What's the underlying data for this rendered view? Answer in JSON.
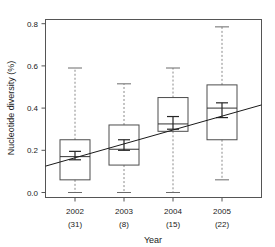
{
  "chart_data": {
    "type": "box",
    "title": "",
    "xlabel": "Year",
    "ylabel": "Nucleotide diversity (%)",
    "ylim": [
      0.0,
      0.83
    ],
    "yticks": [
      0.0,
      0.2,
      0.4,
      0.6,
      0.8
    ],
    "ytick_labels": [
      "0.0",
      "0.2",
      "0.4",
      "0.6",
      "0.8"
    ],
    "grid": false,
    "legend": null,
    "categories": [
      "2002",
      "2003",
      "2004",
      "2005"
    ],
    "sample_sizes": [
      "(31)",
      "(8)",
      "(15)",
      "(22)"
    ],
    "boxes": [
      {
        "category": "2002",
        "n": "(31)",
        "whisker_low": 0.0,
        "q1": 0.06,
        "median": 0.17,
        "q3": 0.25,
        "whisker_high": 0.59,
        "mean": 0.175,
        "ci_low": 0.155,
        "ci_high": 0.195
      },
      {
        "category": "2003",
        "n": "(8)",
        "whisker_low": 0.0,
        "q1": 0.13,
        "median": 0.205,
        "q3": 0.32,
        "whisker_high": 0.515,
        "mean": 0.225,
        "ci_low": 0.2,
        "ci_high": 0.25
      },
      {
        "category": "2004",
        "n": "(15)",
        "whisker_low": 0.0,
        "q1": 0.29,
        "median": 0.325,
        "q3": 0.45,
        "whisker_high": 0.59,
        "mean": 0.33,
        "ci_low": 0.3,
        "ci_high": 0.36
      },
      {
        "category": "2005",
        "n": "(22)",
        "whisker_low": 0.06,
        "q1": 0.25,
        "median": 0.4,
        "q3": 0.51,
        "whisker_high": 0.785,
        "mean": 0.39,
        "ci_low": 0.355,
        "ci_high": 0.425
      }
    ],
    "trend_line": {
      "x_start_value": 0.0,
      "y_start_value": 0.125,
      "x_end_value": 1.0,
      "y_end_value": 0.415
    },
    "colors": {
      "box_stroke": "#4d4d4d",
      "whisker": "#8a8a8a",
      "median": "#333333",
      "mean_marker": "#262626",
      "trend": "#1a1a1a",
      "frame": "#555555",
      "text": "#1a1a1a",
      "background": "#ffffff"
    }
  }
}
